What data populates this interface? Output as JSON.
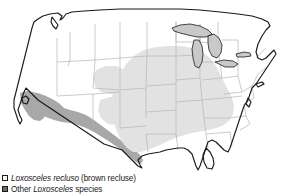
{
  "figure": {
    "kind": "distribution-map",
    "region": "United States"
  },
  "legend": {
    "items": [
      {
        "swatch": "light-square-outlined",
        "swatch_color": "#fbfbfb",
        "species": "Loxosceles recluso",
        "common": " (brown recluse)",
        "prefix": "",
        "full_text": "Loxosceles recluso (brown recluse)"
      },
      {
        "swatch": "dark-square-filled",
        "swatch_color": "#6a6a6a",
        "prefix": "Other ",
        "species": "Loxosceles",
        "common": " species",
        "full_text": "Other Loxosceles species"
      }
    ]
  },
  "map": {
    "colors": {
      "background": "#ffffff",
      "state_fill": "#ffffff",
      "state_border": "#b4b4b4",
      "country_border": "#1a1a1a",
      "lakes": "#c9c9c9",
      "recluse_range": "#e2e2e2",
      "other_species_range": "#a8a8a8"
    },
    "ranges": [
      {
        "name": "Loxosceles recluso (brown recluse)",
        "fill": "#e2e2e2",
        "states": [
          "Nebraska",
          "Iowa",
          "Illinois",
          "Indiana",
          "Ohio",
          "Kentucky",
          "Tennessee",
          "Kansas",
          "Missouri",
          "Arkansas",
          "Oklahoma",
          "Texas",
          "Louisiana",
          "Mississippi",
          "Alabama",
          "Georgia"
        ]
      },
      {
        "name": "Other Loxosceles species",
        "fill": "#a8a8a8",
        "states": [
          "California",
          "Arizona",
          "New Mexico",
          "Nevada",
          "Texas"
        ]
      }
    ],
    "lakes": [
      "Lake Superior",
      "Lake Michigan",
      "Lake Huron",
      "Lake Erie",
      "Lake Ontario"
    ]
  }
}
